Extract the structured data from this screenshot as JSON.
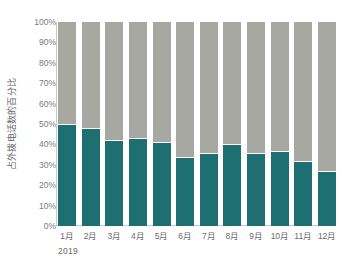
{
  "top_partial_title": "",
  "chart_data": {
    "type": "bar",
    "subtype": "stacked-percent",
    "title": "",
    "xlabel": "",
    "ylabel": "占外拨电话数的百分比",
    "group_label": "2019",
    "ylim": [
      0,
      100
    ],
    "grid": false,
    "legend": "none",
    "y_ticks": [
      "0%",
      "10%",
      "20%",
      "30%",
      "40%",
      "50%",
      "60%",
      "70%",
      "80%",
      "90%",
      "100%"
    ],
    "y_tick_values": [
      0,
      10,
      20,
      30,
      40,
      50,
      60,
      70,
      80,
      90,
      100
    ],
    "categories": [
      "1月",
      "2月",
      "3月",
      "4月",
      "5月",
      "6月",
      "7月",
      "8月",
      "9月",
      "10月",
      "11月",
      "12月"
    ],
    "series": [
      {
        "name": "teal-segment",
        "color": "#1d6f72",
        "values": [
          50,
          48,
          42,
          43,
          41,
          34,
          36,
          40,
          36,
          37,
          32,
          27
        ]
      },
      {
        "name": "gray-segment",
        "color": "#a8a8a2",
        "values": [
          50,
          52,
          58,
          57,
          59,
          66,
          64,
          60,
          64,
          63,
          68,
          73
        ]
      }
    ]
  },
  "colors": {
    "teal": "#1d6f72",
    "gray": "#a8a8a2",
    "axis": "#c9c9c9",
    "text": "#6b6b6b",
    "background": "#ffffff"
  }
}
